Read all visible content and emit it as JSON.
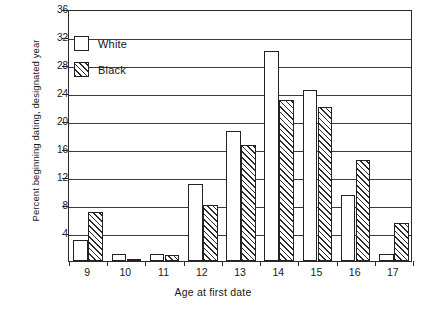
{
  "chart_data": {
    "type": "bar",
    "title": "",
    "xlabel": "Age at first date",
    "ylabel": "Percent beginning dating, designated year",
    "categories": [
      "9",
      "10",
      "11",
      "12",
      "13",
      "14",
      "15",
      "16",
      "17"
    ],
    "series": [
      {
        "name": "White",
        "values": [
          3,
          1,
          1,
          11,
          18.6,
          30,
          24.5,
          9.5,
          1
        ]
      },
      {
        "name": "Black",
        "values": [
          7,
          0.3,
          0.8,
          8,
          16.6,
          23,
          22,
          14.5,
          5.5
        ]
      }
    ],
    "ylim": [
      0,
      36
    ],
    "yticks": [
      4,
      8,
      12,
      16,
      20,
      24,
      28,
      32,
      36
    ],
    "ytick_labels": [
      "4",
      "8",
      "12",
      "16",
      "20",
      "24",
      "28",
      "32",
      "36"
    ],
    "grid": true,
    "grid_axis": "y",
    "legend": {
      "position": "top-left",
      "entries": [
        {
          "label": "White",
          "swatch": "empty"
        },
        {
          "label": "Black",
          "swatch": "hatched"
        }
      ]
    },
    "colors": {
      "axis": "#2a2a2a",
      "grid": "#3a3a3a",
      "bar_outline": "#222222",
      "white_fill": "#ffffff",
      "black_hatch": "#2b2b2b"
    }
  }
}
